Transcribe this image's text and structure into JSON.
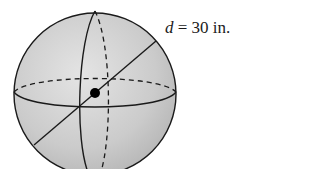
{
  "diagram": {
    "type": "sphere",
    "label": {
      "variable": "d",
      "equals": " = ",
      "value": "30",
      "unit": " in."
    },
    "colors": {
      "sphere_fill": "#c9c9c9",
      "sphere_highlight": "#e2e2e2",
      "stroke": "#1a1a1a",
      "background": "#ffffff"
    },
    "geometry": {
      "center": [
        95,
        94
      ],
      "radius": 81,
      "diameter_line": {
        "from": [
          34,
          145
        ],
        "to": [
          156,
          41
        ]
      }
    }
  }
}
